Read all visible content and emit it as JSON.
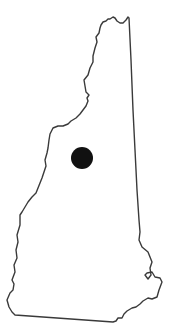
{
  "map": {
    "region": "New Hampshire",
    "outline_color": "#3a3a3a",
    "fill_color": "#ffffff",
    "marker": {
      "cx": 82,
      "cy": 158,
      "r": 11,
      "color": "#111111"
    }
  }
}
